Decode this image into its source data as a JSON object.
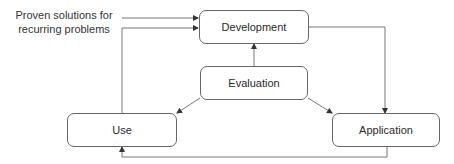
{
  "diagram": {
    "input_label": "Proven solutions for recurring problems",
    "input_label_lines": [
      "Proven solutions for",
      "recurring problems"
    ],
    "nodes": {
      "development": "Development",
      "evaluation": "Evaluation",
      "use": "Use",
      "application": "Application"
    },
    "edges": [
      {
        "from": "input_label",
        "to": "development"
      },
      {
        "from": "use",
        "to": "development"
      },
      {
        "from": "evaluation",
        "to": "development"
      },
      {
        "from": "evaluation",
        "to": "use"
      },
      {
        "from": "evaluation",
        "to": "application"
      },
      {
        "from": "development",
        "to": "application"
      },
      {
        "from": "application",
        "to": "use"
      }
    ],
    "colors": {
      "line": "#666666",
      "box_border": "#666666",
      "text": "#2a2a2a"
    }
  }
}
